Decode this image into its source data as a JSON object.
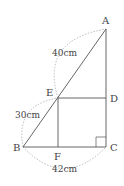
{
  "diagram": {
    "points": {
      "A": {
        "label": "A",
        "x": 106,
        "y": 29
      },
      "B": {
        "label": "B",
        "x": 23,
        "y": 147
      },
      "C": {
        "label": "C",
        "x": 106,
        "y": 147
      },
      "D": {
        "label": "D",
        "x": 106,
        "y": 98
      },
      "E": {
        "label": "E",
        "x": 58,
        "y": 98
      },
      "F": {
        "label": "F",
        "x": 58,
        "y": 147
      }
    },
    "lengths": {
      "AE": "40cm",
      "EB": "30cm",
      "BC": "42cm"
    },
    "colors": {
      "line": "#555555",
      "dashed": "#aaaaaa",
      "text": "#444444"
    }
  }
}
